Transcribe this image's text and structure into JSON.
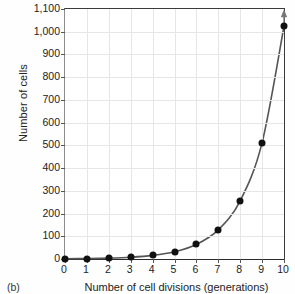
{
  "chart_data": {
    "type": "line",
    "title": "",
    "panel_label": "(b)",
    "xlabel": "Number of cell divisions (generations)",
    "ylabel": "Number of cells",
    "x": [
      0,
      1,
      2,
      3,
      4,
      5,
      6,
      7,
      8,
      9,
      10
    ],
    "values": [
      1,
      2,
      4,
      8,
      16,
      32,
      64,
      128,
      256,
      512,
      1024
    ],
    "series": [
      {
        "name": "Number of cells",
        "values": [
          1,
          2,
          4,
          8,
          16,
          32,
          64,
          128,
          256,
          512,
          1024
        ]
      }
    ],
    "xlim": [
      0,
      10
    ],
    "ylim": [
      0,
      1100
    ],
    "xticks": [
      "0",
      "1",
      "2",
      "3",
      "4",
      "5",
      "6",
      "7",
      "8",
      "9",
      "10"
    ],
    "xtick_values": [
      0,
      1,
      2,
      3,
      4,
      5,
      6,
      7,
      8,
      9,
      10
    ],
    "yticks": [
      "0",
      "100",
      "200",
      "300",
      "400",
      "500",
      "600",
      "700",
      "800",
      "900",
      "1,000",
      "1,100"
    ],
    "ytick_values": [
      0,
      100,
      200,
      300,
      400,
      500,
      600,
      700,
      800,
      900,
      1000,
      1100
    ],
    "grid": true,
    "legend": "none",
    "marker": "filled-circle",
    "annotations": [
      "arrowhead at top of curve beyond final point"
    ],
    "line_color": "#555555",
    "marker_color": "#111111",
    "grid_color": "#e6e6e6",
    "axis_color": "#2a2a2a"
  }
}
